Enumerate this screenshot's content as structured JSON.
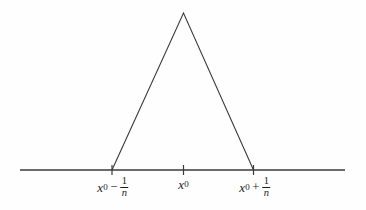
{
  "figure": {
    "name": "triangular-spike-function",
    "background_color": "#fefefe",
    "line_color": "#3a3a3a",
    "text_color": "#1c1c1c",
    "axis": {
      "name": "horizontal-axis",
      "x_start": 20,
      "x_end": 345,
      "y": 170,
      "stroke_width": 1.4
    },
    "ticks": [
      {
        "name": "tick-left",
        "x": 112,
        "y": 170,
        "half_length": 5
      },
      {
        "name": "tick-center",
        "x": 183.5,
        "y": 170,
        "half_length": 5
      },
      {
        "name": "tick-right",
        "x": 253.5,
        "y": 170,
        "half_length": 5
      }
    ],
    "triangle": {
      "name": "spike-triangle",
      "apex": {
        "x": 183.5,
        "y": 13
      },
      "left_base": {
        "x": 112,
        "y": 170
      },
      "right_base": {
        "x": 253.5,
        "y": 170
      },
      "stroke_width": 1.1,
      "fill": "none"
    },
    "labels": [
      {
        "name": "label-left",
        "x": 113,
        "y": 176,
        "variable": "x",
        "subscript": "0",
        "operator": "−",
        "fraction_numerator": "1",
        "fraction_denominator": "n",
        "text": "x0 − 1/n"
      },
      {
        "name": "label-center",
        "x": 183.5,
        "y": 178,
        "variable": "x",
        "subscript": "0",
        "operator": "",
        "fraction_numerator": "",
        "fraction_denominator": "",
        "text": "x0"
      },
      {
        "name": "label-right",
        "x": 255,
        "y": 176,
        "variable": "x",
        "subscript": "0",
        "operator": "+",
        "fraction_numerator": "1",
        "fraction_denominator": "n",
        "text": "x0 + 1/n"
      }
    ]
  },
  "chart_data": {
    "type": "line",
    "title": "",
    "subtitle": "",
    "xlabel": "",
    "ylabel": "",
    "grid": false,
    "legend_position": "none",
    "xlim": [
      20,
      345
    ],
    "ylim": [
      0,
      170
    ],
    "x_tick_labels": [
      "x0 − 1/n",
      "x0",
      "x0 + 1/n"
    ],
    "x_tick_positions": [
      112,
      183.5,
      253.5
    ],
    "series": [
      {
        "name": "triangular-spike",
        "x": [
          112,
          183.5,
          253.5
        ],
        "y": [
          0,
          157,
          0
        ]
      },
      {
        "name": "baseline-axis",
        "x": [
          20,
          345
        ],
        "y": [
          0,
          0
        ]
      }
    ]
  }
}
